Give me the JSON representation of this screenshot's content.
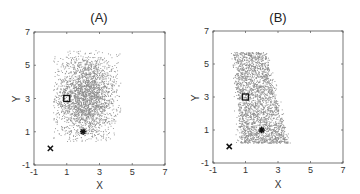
{
  "chart_data": [
    {
      "type": "scatter",
      "title": "(A)",
      "xlabel": "X",
      "ylabel": "Y",
      "xlim": [
        -1,
        7
      ],
      "ylim": [
        -1,
        7
      ],
      "xticks": [
        -1,
        1,
        3,
        5,
        7
      ],
      "yticks": [
        -1,
        1,
        3,
        5,
        7
      ],
      "xtick_labels": [
        "-1",
        "1",
        "3",
        "5",
        "7"
      ],
      "ytick_labels": [
        "-1",
        "1",
        "3",
        "5",
        "7"
      ],
      "grid": false,
      "legend": null,
      "point_color": "#8a8a8a",
      "cloud": {
        "description": "dense roughly uniform cloud",
        "count": 2600,
        "x_range": [
          0.2,
          4.3
        ],
        "y_range": [
          0.4,
          5.9
        ],
        "center": [
          2.2,
          3.1
        ],
        "skew": 0
      },
      "markers": [
        {
          "name": "square",
          "symbol": "square",
          "x": 1,
          "y": 3
        },
        {
          "name": "asterisk",
          "symbol": "asterisk",
          "x": 2,
          "y": 1
        },
        {
          "name": "cross",
          "symbol": "x",
          "x": 0,
          "y": 0
        }
      ]
    },
    {
      "type": "scatter",
      "title": "(B)",
      "xlabel": "X",
      "ylabel": "Y",
      "xlim": [
        -1,
        7
      ],
      "ylim": [
        -1,
        7
      ],
      "xticks": [
        -1,
        1,
        3,
        5,
        7
      ],
      "yticks": [
        -1,
        1,
        3,
        5,
        7
      ],
      "xtick_labels": [
        "-1",
        "1",
        "3",
        "5",
        "7"
      ],
      "ytick_labels": [
        "-1",
        "1",
        "3",
        "5",
        "7"
      ],
      "grid": false,
      "legend": null,
      "point_color": "#8a8a8a",
      "cloud": {
        "description": "skewed cloud, denser toward lower center",
        "count": 2600,
        "x_range": [
          0.1,
          4.1
        ],
        "y_range": [
          0.2,
          5.7
        ],
        "center": [
          1.9,
          2.4
        ],
        "skew": 1
      },
      "markers": [
        {
          "name": "square",
          "symbol": "square",
          "x": 1,
          "y": 3
        },
        {
          "name": "asterisk",
          "symbol": "asterisk",
          "x": 2,
          "y": 1
        },
        {
          "name": "cross",
          "symbol": "x",
          "x": 0,
          "y": 0
        }
      ]
    }
  ]
}
